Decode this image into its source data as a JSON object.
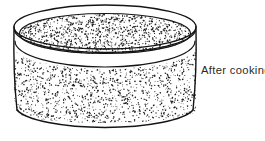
{
  "figure": {
    "kind": "line-drawing",
    "caption": "After cooking",
    "colors": {
      "background": "#ffffff",
      "outline": "#1a1a1a",
      "stipple": "#202020",
      "caption_text": "#2a2a2a",
      "fill": "#ffffff"
    },
    "geometry": {
      "cylinder_left_x": 14,
      "cylinder_right_x": 196,
      "rim_outer_top_y": 5,
      "rim_outer_center_y": 27,
      "rim_ellipse_rx": 91,
      "rim_ellipse_ry": 22,
      "rim_lip_offset_y": 6,
      "content_surface_center_y": 40,
      "body_bottom_center_y": 110,
      "bottom_ellipse_ry": 13,
      "bottom_lowest_y": 132
    },
    "stipple": {
      "description": "dense random dot texture filling the interior and the cylinder wall",
      "dot_count_wall": 2400,
      "dot_count_top": 1500,
      "dot_size_px": 1.1
    }
  },
  "annotations": [
    {
      "id": "after-cooking",
      "text": "After cooking",
      "x": 201,
      "y": 63
    }
  ]
}
